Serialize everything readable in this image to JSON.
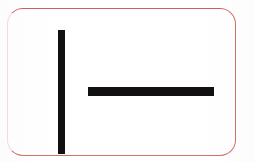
{
  "canvas": {
    "width": 255,
    "height": 162,
    "background_color": "#ffffff"
  },
  "card": {
    "label": "rounded-rectangle-card",
    "border_color": "#d07068",
    "border_color_faded": "#f2dedc",
    "border_width_px": 1,
    "corner_radius_px": 16,
    "fill_color": "#ffffff",
    "left_px": 7,
    "top_px": 8,
    "width_px": 229,
    "height_px": 148
  },
  "marks": {
    "ink_color": "#121010",
    "description": "two solid black strokes forming a vertical bar beside a horizontal bar",
    "strokes": [
      {
        "name": "vertical-stroke",
        "orientation": "vertical",
        "left_px": 50,
        "top_px": 21,
        "width_px": 7,
        "height_px": 124,
        "color": "#121010"
      },
      {
        "name": "horizontal-stroke",
        "orientation": "horizontal",
        "left_px": 80,
        "top_px": 78,
        "width_px": 126,
        "height_px": 9,
        "color": "#121010"
      }
    ]
  }
}
